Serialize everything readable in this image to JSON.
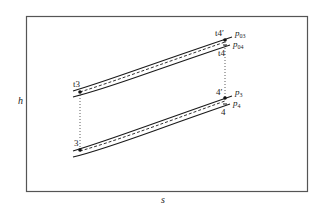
{
  "diagram": {
    "type": "enthalpy-entropy (h-s) diagram",
    "axes": {
      "y_label": "h",
      "x_label": "s"
    },
    "upper_pair": {
      "solid_upper_label": "p03",
      "solid_upper_label_main": "p",
      "solid_upper_label_sub": "03",
      "solid_lower_label": "p04",
      "solid_lower_label_main": "p",
      "solid_lower_label_sub": "04",
      "start_point_label": "t3",
      "end_point_ideal_label": "t4′",
      "end_point_actual_label": "t4"
    },
    "lower_pair": {
      "solid_upper_label": "p3",
      "solid_upper_label_main": "p",
      "solid_upper_label_sub": "3",
      "solid_lower_label": "p4",
      "solid_lower_label_main": "p",
      "solid_lower_label_sub": "4",
      "start_point_label": "3",
      "end_point_ideal_label": "4′",
      "end_point_actual_label": "4"
    },
    "colors": {
      "line": "#1a1a1a",
      "frame": "#555555"
    }
  }
}
